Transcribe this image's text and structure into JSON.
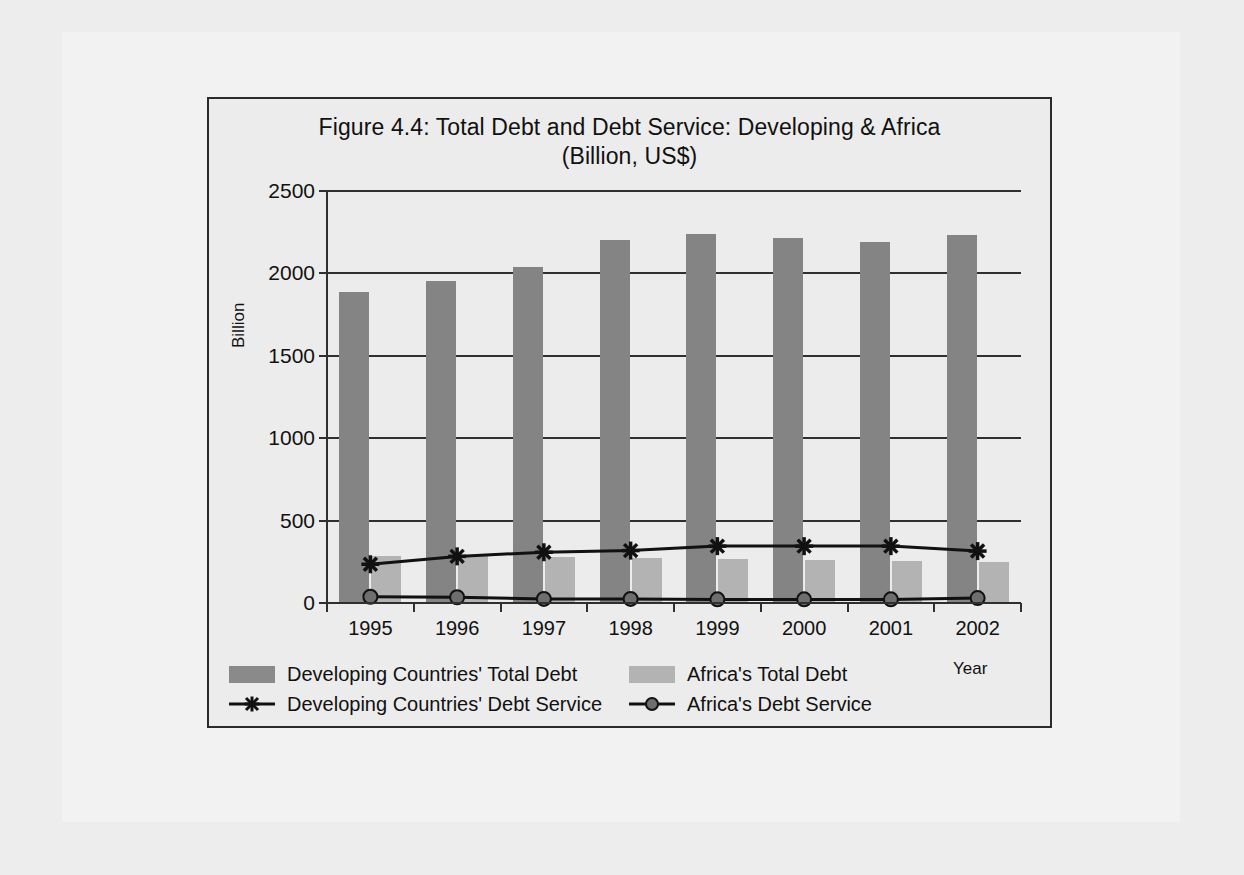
{
  "figure": {
    "title_line1": "Figure 4.4: Total Debt and Debt Service: Developing & Africa",
    "title_line2": "(Billion, US$)"
  },
  "axes": {
    "y_title": "Billion",
    "x_title": "Year"
  },
  "colors": {
    "developing_total_debt": "#848484",
    "africa_total_debt": "#b3b3b3",
    "line_color": "#111111",
    "axis_color": "#2f2f2f",
    "plot_background": "#ececec",
    "page_background": "#ededed",
    "frame_border": "#2b2b2b"
  },
  "chart_data": {
    "type": "bar",
    "title": "Figure 4.4: Total Debt and Debt Service: Developing & Africa (Billion, US$)",
    "xlabel": "Year",
    "ylabel": "Billion",
    "ylim": [
      0,
      2500
    ],
    "yticks": [
      0,
      500,
      1000,
      1500,
      2000,
      2500
    ],
    "grid": true,
    "legend_position": "bottom",
    "categories": [
      "1995",
      "1996",
      "1997",
      "1998",
      "1999",
      "2000",
      "2001",
      "2002"
    ],
    "series": [
      {
        "name": "Developing Countries' Total Debt",
        "type": "bar",
        "color": "#848484",
        "values": [
          1890,
          1955,
          2040,
          2205,
          2240,
          2215,
          2190,
          2235
        ]
      },
      {
        "name": "Africa's Total Debt",
        "type": "bar",
        "color": "#b3b3b3",
        "values": [
          285,
          290,
          280,
          275,
          270,
          260,
          255,
          250
        ]
      },
      {
        "name": "Developing Countries' Debt Service",
        "type": "line",
        "marker": "asterisk",
        "color": "#111111",
        "values": [
          235,
          283,
          308,
          318,
          345,
          345,
          345,
          315
        ]
      },
      {
        "name": "Africa's Debt Service",
        "type": "line",
        "marker": "circle",
        "color": "#111111",
        "values": [
          38,
          35,
          25,
          25,
          22,
          22,
          22,
          30
        ]
      }
    ]
  },
  "legend": {
    "entries": [
      {
        "label": "Developing Countries' Total Debt",
        "kind": "swatch",
        "color": "#8a8a8a"
      },
      {
        "label": "Africa's Total Debt",
        "kind": "swatch",
        "color": "#b3b3b3"
      },
      {
        "label": "Developing Countries' Debt Service",
        "kind": "line-asterisk",
        "color": "#111111"
      },
      {
        "label": "Africa's Debt Service",
        "kind": "line-circle",
        "color": "#111111"
      }
    ]
  }
}
